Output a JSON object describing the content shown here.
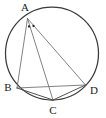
{
  "figure": {
    "width": 106,
    "height": 118,
    "background_color": "#ffffff"
  },
  "circle": {
    "name": "circumcircle",
    "center_x": 52,
    "center_y": 53.5,
    "radius": 46.5,
    "stroke_color": "#3a3a3a",
    "stroke_width": 1.25
  },
  "points": [
    {
      "id": "A",
      "label": "A",
      "x": 27.5,
      "y": 18.5,
      "label_x": 25.0,
      "label_y": 8.0
    },
    {
      "id": "B",
      "label": "B",
      "x": 17.0,
      "y": 88.0,
      "label_x": 8.0,
      "label_y": 88.0
    },
    {
      "id": "C",
      "label": "C",
      "x": 53.0,
      "y": 100.0,
      "label_x": 53.0,
      "label_y": 111.0
    },
    {
      "id": "D",
      "label": "D",
      "x": 85.5,
      "y": 85.0,
      "label_x": 94.0,
      "label_y": 91.0
    }
  ],
  "segments": [
    {
      "id": "AB",
      "from": "A",
      "to": "B",
      "style": "light",
      "stroke_color": "#6b6b6b"
    },
    {
      "id": "AC",
      "from": "A",
      "to": "C",
      "style": "light",
      "stroke_color": "#6b6b6b"
    },
    {
      "id": "AD",
      "from": "A",
      "to": "D",
      "style": "light",
      "stroke_color": "#6b6b6b"
    },
    {
      "id": "BC",
      "from": "B",
      "to": "C",
      "style": "dark",
      "stroke_color": "#4a4a4a"
    },
    {
      "id": "CD",
      "from": "C",
      "to": "D",
      "style": "dark",
      "stroke_color": "#4a4a4a"
    },
    {
      "id": "BD",
      "from": "B",
      "to": "D",
      "style": "light",
      "stroke_color": "#6b6b6b"
    }
  ],
  "angle_marks": {
    "vertex": "A",
    "description": "two dot ticks marking equal angles BAC and CAD",
    "marks": [
      {
        "id": "tick-1",
        "x": 29.0,
        "y": 26.5,
        "r": 1.15
      },
      {
        "id": "tick-2",
        "x": 33.5,
        "y": 26.0,
        "r": 1.15
      }
    ]
  }
}
